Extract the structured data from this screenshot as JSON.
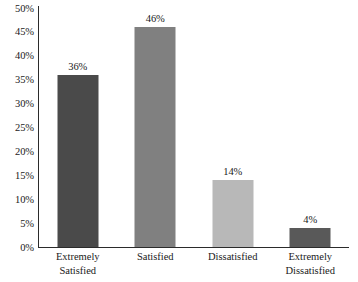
{
  "chart_data": {
    "type": "bar",
    "title": "",
    "subtitle": "",
    "xlabel": "",
    "ylabel": "",
    "categories": [
      "Extremely Satisfied",
      "Satisfied",
      "Dissatisfied",
      "Extremely Dissatisfied"
    ],
    "category_lines": [
      [
        "Extremely",
        "Satisfied"
      ],
      [
        "Satisfied",
        ""
      ],
      [
        "Dissatisfied",
        ""
      ],
      [
        "Extremely",
        "Dissatisfied"
      ]
    ],
    "values": [
      36,
      46,
      14,
      4
    ],
    "value_labels": [
      "36%",
      "46%",
      "14%",
      "4%"
    ],
    "bar_colors": [
      "#4a4a4a",
      "#808080",
      "#b8b8b8",
      "#595959"
    ],
    "ylim": [
      0,
      50
    ],
    "ytick_values": [
      0,
      5,
      10,
      15,
      20,
      25,
      30,
      35,
      40,
      45,
      50
    ],
    "ytick_labels": [
      "0%",
      "5%",
      "10%",
      "15%",
      "20%",
      "25%",
      "30%",
      "35%",
      "40%",
      "45%",
      "50%"
    ],
    "grid": false,
    "legend": "none",
    "axis_color": "#2b2b2b",
    "background_color": "#ffffff",
    "text_color": "#1a1a1a"
  }
}
